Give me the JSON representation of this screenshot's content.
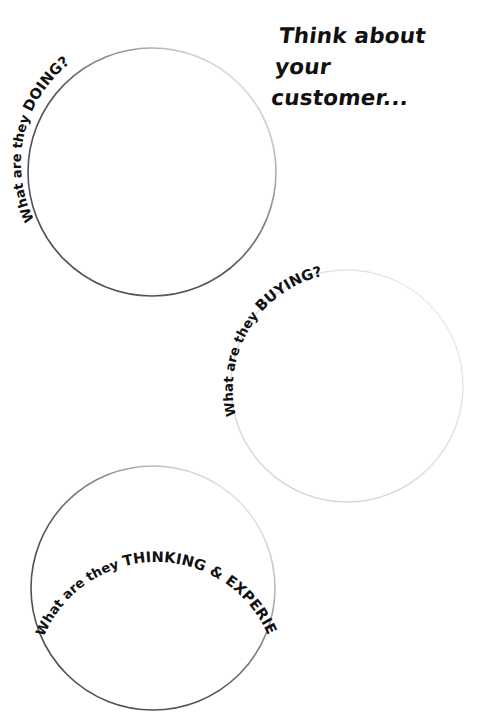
{
  "page": {
    "background_color": "#ffffff",
    "width": 486,
    "height": 727,
    "kind": "worksheet"
  },
  "headline": {
    "text": "Think about your\ncustomer...",
    "line1": "Think about your",
    "line2": "customer...",
    "color": "#111111"
  },
  "circles": [
    {
      "id": "doing",
      "label_lead": "What are they ",
      "label_key": "DOING?",
      "label_full": "What are they DOING?",
      "cx": 152,
      "cy": 172,
      "r": 124,
      "stroke_color": "#4f4f4f",
      "stroke_color_faded": "#e8e8e8",
      "stroke_width": 1.6,
      "fill": "#ffffff",
      "label_arc_start_deg": 196,
      "label_arc_sweep_deg": 104
    },
    {
      "id": "buying",
      "label_lead": "What are they ",
      "label_key": "BUYING?",
      "label_full": "What are they BUYING?",
      "cx": 347,
      "cy": 386,
      "r": 116,
      "stroke_color": "#d9d9d9",
      "stroke_color_faded": "#f2f2f2",
      "stroke_width": 1.3,
      "fill": "#ffffff",
      "label_arc_start_deg": 198,
      "label_arc_sweep_deg": 104
    },
    {
      "id": "thinking",
      "label_lead": "What are they ",
      "label_key": "THINKING & EXPERIENCING?",
      "label_full": "What are they THINKING & EXPERIENCING?",
      "cx": 153,
      "cy": 588,
      "r": 122,
      "stroke_color": "#4f4f4f",
      "stroke_color_faded": "#ededed",
      "stroke_width": 1.6,
      "fill": "#ffffff",
      "label_arc_start_deg": 202,
      "label_arc_sweep_deg": 170
    }
  ]
}
